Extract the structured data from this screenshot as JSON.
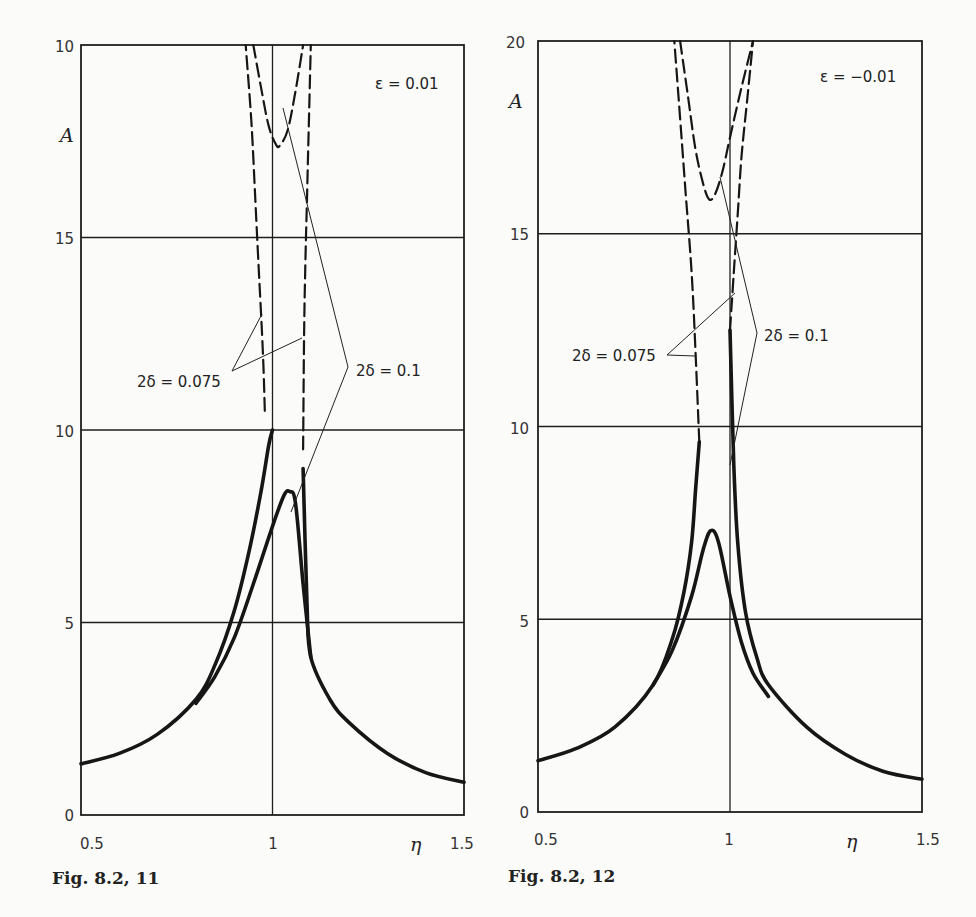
{
  "figures": [
    {
      "caption": "Fig. 8.2, 11",
      "param_label": "ε = 0.01",
      "y_axis_label": "A",
      "x_axis_label": "η",
      "x_ticks": [
        "0.5",
        "1",
        "1.5"
      ],
      "y_ticks": [
        "0",
        "5",
        "10",
        "15",
        "10"
      ],
      "annotation_a": "2δ = 0.075",
      "annotation_b": "2δ = 0.1"
    },
    {
      "caption": "Fig. 8.2, 12",
      "param_label": "ε = −0.01",
      "y_axis_label": "A",
      "x_axis_label": "η",
      "x_ticks": [
        "0.5",
        "1",
        "1.5"
      ],
      "y_ticks": [
        "0",
        "5",
        "10",
        "15",
        "20"
      ],
      "annotation_a": "2δ = 0.075",
      "annotation_b": "2δ = 0.1"
    }
  ],
  "chart_data": [
    {
      "type": "line",
      "title": "Fig. 8.2, 11",
      "subtitle": "ε = 0.01",
      "xlabel": "η",
      "ylabel": "A",
      "xlim": [
        0.5,
        1.5
      ],
      "ylim": [
        0,
        20
      ],
      "x_tick_labels": [
        "0.5",
        "1",
        "1.5"
      ],
      "y_tick_labels": [
        "0",
        "5",
        "10",
        "15",
        "10"
      ],
      "y_tick_note": "top tick printed as '10' in original (represents 20)",
      "grid": true,
      "series": [
        {
          "name": "2δ = 0.075 (stable, solid)",
          "style": "solid-thick",
          "x": [
            0.5,
            0.6,
            0.7,
            0.8,
            0.85,
            0.9,
            0.94,
            0.97,
            0.99,
            1.0
          ],
          "y": [
            1.33,
            1.6,
            2.1,
            3.0,
            3.9,
            5.3,
            6.9,
            8.4,
            9.6,
            10.0
          ]
        },
        {
          "name": "2δ = 0.075 (right branch, solid)",
          "style": "solid-thick",
          "x": [
            1.08,
            1.09,
            1.1,
            1.15,
            1.2,
            1.3,
            1.4,
            1.5
          ],
          "y": [
            9.0,
            5.5,
            4.1,
            3.0,
            2.4,
            1.6,
            1.1,
            0.85
          ]
        },
        {
          "name": "2δ = 0.1 (stable, solid)",
          "style": "solid-thick",
          "x": [
            0.8,
            0.85,
            0.9,
            0.95,
            1.0,
            1.03,
            1.045,
            1.06,
            1.08,
            1.1
          ],
          "y": [
            2.9,
            3.6,
            4.6,
            6.0,
            7.5,
            8.3,
            8.4,
            8.1,
            6.0,
            4.1
          ]
        },
        {
          "name": "2δ = 0.075 (unstable, dashed, left)",
          "style": "dashed",
          "x": [
            0.98,
            0.975,
            0.965,
            0.955,
            0.945,
            0.93
          ],
          "y": [
            10.5,
            12.0,
            14.0,
            16.0,
            18.0,
            20.0
          ]
        },
        {
          "name": "2δ = 0.075 (unstable, dashed, right)",
          "style": "dashed",
          "x": [
            1.08,
            1.082,
            1.085,
            1.09,
            1.095,
            1.1
          ],
          "y": [
            9.5,
            12.0,
            14.0,
            16.0,
            18.0,
            20.0
          ]
        },
        {
          "name": "2δ = 0.1 (unstable, dashed)",
          "style": "dashed",
          "x": [
            0.95,
            0.97,
            0.99,
            1.01,
            1.02,
            1.04,
            1.06,
            1.08
          ],
          "y": [
            20.0,
            18.9,
            17.9,
            17.4,
            17.4,
            17.8,
            18.8,
            20.0
          ]
        }
      ],
      "annotations": [
        {
          "text": "ε = 0.01",
          "x": 1.38,
          "y": 19.0
        },
        {
          "text": "2δ = 0.075",
          "x": 0.75,
          "y": 10.7
        },
        {
          "text": "2δ = 0.1",
          "x": 1.28,
          "y": 11.0
        }
      ]
    },
    {
      "type": "line",
      "title": "Fig. 8.2, 12",
      "subtitle": "ε = −0.01",
      "xlabel": "η",
      "ylabel": "A",
      "xlim": [
        0.5,
        1.5
      ],
      "ylim": [
        0,
        20
      ],
      "x_tick_labels": [
        "0.5",
        "1",
        "1.5"
      ],
      "y_tick_labels": [
        "0",
        "5",
        "10",
        "15",
        "20"
      ],
      "grid": true,
      "series": [
        {
          "name": "2δ = 0.075 (left branch, solid)",
          "style": "solid-thick",
          "x": [
            0.5,
            0.6,
            0.7,
            0.8,
            0.85,
            0.88,
            0.9,
            0.91,
            0.92
          ],
          "y": [
            1.33,
            1.65,
            2.2,
            3.3,
            4.5,
            5.7,
            7.0,
            8.3,
            9.6
          ]
        },
        {
          "name": "2δ = 0.075 (right branch, solid)",
          "style": "solid-thick",
          "x": [
            1.0,
            1.01,
            1.02,
            1.04,
            1.07,
            1.1,
            1.2,
            1.3,
            1.4,
            1.5
          ],
          "y": [
            12.5,
            9.0,
            7.0,
            5.2,
            4.0,
            3.3,
            2.2,
            1.5,
            1.05,
            0.85
          ]
        },
        {
          "name": "2δ = 0.1 (stable, solid)",
          "style": "solid-thick",
          "x": [
            0.8,
            0.85,
            0.9,
            0.93,
            0.95,
            0.97,
            1.0,
            1.03,
            1.06,
            1.1
          ],
          "y": [
            3.3,
            4.2,
            5.6,
            6.8,
            7.3,
            7.0,
            5.6,
            4.4,
            3.6,
            3.0
          ]
        },
        {
          "name": "2δ = 0.075 (unstable, dashed, left)",
          "style": "dashed",
          "x": [
            0.92,
            0.91,
            0.9,
            0.885,
            0.87,
            0.855
          ],
          "y": [
            9.6,
            12.0,
            14.0,
            16.0,
            18.0,
            20.0
          ]
        },
        {
          "name": "2δ = 0.075 (unstable, dashed, right)",
          "style": "dashed",
          "x": [
            1.0,
            1.01,
            1.02,
            1.03,
            1.045,
            1.06
          ],
          "y": [
            12.5,
            14.0,
            15.5,
            17.0,
            18.5,
            20.0
          ]
        },
        {
          "name": "2δ = 0.1 (unstable, dashed)",
          "style": "dashed",
          "x": [
            0.87,
            0.89,
            0.91,
            0.93,
            0.945,
            0.96,
            0.98,
            1.0,
            1.03,
            1.06
          ],
          "y": [
            20.0,
            18.6,
            17.2,
            16.3,
            15.9,
            16.0,
            16.6,
            17.5,
            18.8,
            20.0
          ]
        }
      ],
      "annotations": [
        {
          "text": "ε = −0.01",
          "x": 1.35,
          "y": 19.0
        },
        {
          "text": "2δ = 0.075",
          "x": 0.68,
          "y": 10.5
        },
        {
          "text": "2δ = 0.1",
          "x": 1.1,
          "y": 11.0
        }
      ]
    }
  ]
}
